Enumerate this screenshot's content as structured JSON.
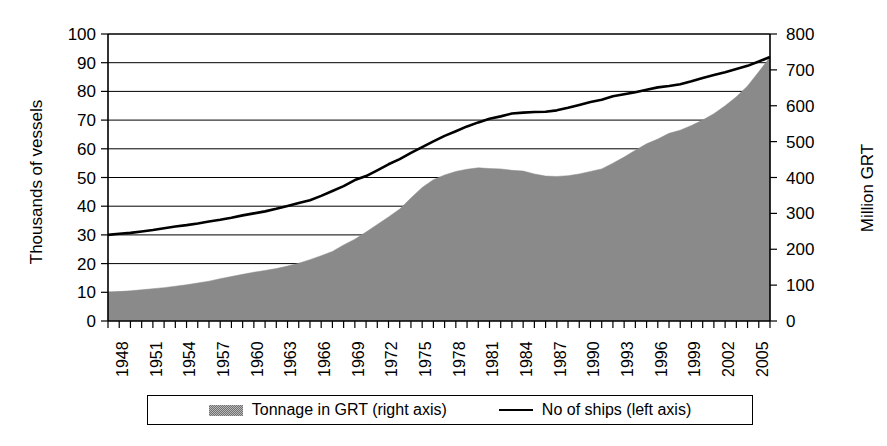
{
  "chart_data": {
    "type": "area",
    "title": "",
    "subtitle": "",
    "xlabel": "",
    "ylabel": "Thousands of vessels",
    "ylabel_secondary": "Million GRT",
    "grid": true,
    "legend_position": "bottom",
    "xlim": [
      1948,
      2007
    ],
    "ylim": [
      0,
      100
    ],
    "ylim_secondary": [
      0,
      800
    ],
    "yticks": [
      0,
      10,
      20,
      30,
      40,
      50,
      60,
      70,
      80,
      90,
      100
    ],
    "yticks_secondary": [
      0,
      100,
      200,
      300,
      400,
      500,
      600,
      700,
      800
    ],
    "xticks": [
      1948,
      1951,
      1954,
      1957,
      1960,
      1963,
      1966,
      1969,
      1972,
      1975,
      1978,
      1981,
      1984,
      1987,
      1990,
      1993,
      1996,
      1999,
      2002,
      2005
    ],
    "x": [
      1948,
      1949,
      1950,
      1951,
      1952,
      1953,
      1954,
      1955,
      1956,
      1957,
      1958,
      1959,
      1960,
      1961,
      1962,
      1963,
      1964,
      1965,
      1966,
      1967,
      1968,
      1969,
      1970,
      1971,
      1972,
      1973,
      1974,
      1975,
      1976,
      1977,
      1978,
      1979,
      1980,
      1981,
      1982,
      1983,
      1984,
      1985,
      1986,
      1987,
      1988,
      1989,
      1990,
      1991,
      1992,
      1993,
      1994,
      1995,
      1996,
      1997,
      1998,
      1999,
      2000,
      2001,
      2002,
      2003,
      2004,
      2005,
      2006,
      2007
    ],
    "series": [
      {
        "name": "Tonnage in GRT (right axis)",
        "axis": "right",
        "render": "area",
        "unit": "Million GRT",
        "color": "#8a8a8a",
        "values": [
          80,
          82,
          84,
          87,
          90,
          93,
          97,
          101,
          106,
          111,
          118,
          124,
          130,
          136,
          141,
          146,
          153,
          161,
          171,
          182,
          194,
          212,
          228,
          248,
          269,
          290,
          312,
          343,
          372,
          394,
          407,
          417,
          423,
          427,
          425,
          424,
          420,
          418,
          410,
          404,
          403,
          405,
          410,
          417,
          424,
          440,
          457,
          476,
          494,
          507,
          523,
          532,
          545,
          560,
          578,
          600,
          625,
          655,
          695,
          735
        ]
      },
      {
        "name": "No of ships (left axis)",
        "axis": "left",
        "render": "line",
        "unit": "Thousands of vessels",
        "color": "#000000",
        "values": [
          30.0,
          30.4,
          30.7,
          31.2,
          31.7,
          32.3,
          32.9,
          33.4,
          34.0,
          34.7,
          35.3,
          36.0,
          36.8,
          37.5,
          38.2,
          39.1,
          40.1,
          41.1,
          42.1,
          43.6,
          45.3,
          47.0,
          49.1,
          50.5,
          52.5,
          54.6,
          56.4,
          58.6,
          60.6,
          62.6,
          64.5,
          66.1,
          67.8,
          69.2,
          70.5,
          71.3,
          72.3,
          72.6,
          72.8,
          72.9,
          73.4,
          74.3,
          75.3,
          76.3,
          77.1,
          78.3,
          79.0,
          79.7,
          80.6,
          81.4,
          81.9,
          82.5,
          83.5,
          84.7,
          85.7,
          86.7,
          87.8,
          88.9,
          90.4,
          92.0
        ]
      }
    ]
  },
  "axes": {
    "left_title": "Thousands of vessels",
    "right_title": "Million GRT"
  },
  "legend": {
    "items": [
      {
        "label": "Tonnage in GRT (right axis)",
        "marker": "area-swatch"
      },
      {
        "label": "No of ships (left axis)",
        "marker": "line-swatch"
      }
    ]
  }
}
